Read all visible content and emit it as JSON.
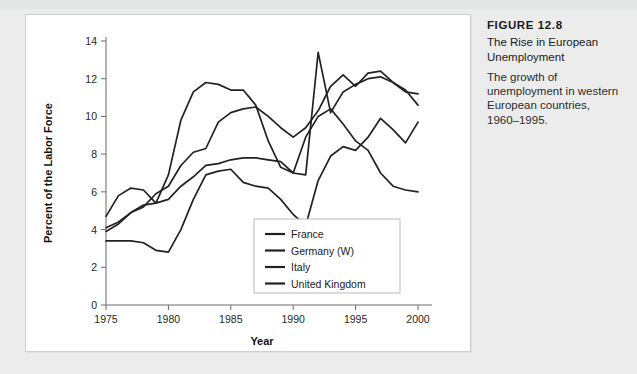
{
  "caption": {
    "figure_number": "FIGURE 12.8",
    "title": "The Rise in European Unemployment",
    "description": "The growth of unemployment in western European countries, 1960–1995."
  },
  "chart_data": {
    "type": "line",
    "title": "The Rise in European Unemployment",
    "xlabel": "Year",
    "ylabel": "Percent of the Labor Force",
    "xlim": [
      1975,
      2000
    ],
    "ylim": [
      0,
      14
    ],
    "xticks": [
      1975,
      1980,
      1985,
      1990,
      1995,
      2000
    ],
    "yticks": [
      0,
      2,
      4,
      6,
      8,
      10,
      12,
      14
    ],
    "grid": false,
    "legend_position": "lower center",
    "x": [
      1975,
      1976,
      1977,
      1978,
      1979,
      1980,
      1981,
      1982,
      1983,
      1984,
      1985,
      1986,
      1987,
      1988,
      1989,
      1990,
      1991,
      1992,
      1993,
      1994,
      1995,
      1996,
      1997,
      1998,
      1999,
      2000
    ],
    "series": [
      {
        "name": "France",
        "values": [
          4.1,
          4.4,
          4.9,
          5.2,
          5.9,
          6.3,
          7.4,
          8.1,
          8.3,
          9.7,
          10.2,
          10.4,
          10.5,
          10.0,
          9.4,
          8.9,
          9.4,
          10.3,
          11.6,
          12.2,
          11.6,
          12.3,
          12.4,
          11.8,
          11.3,
          11.2
        ]
      },
      {
        "name": "Germany (W)",
        "values": [
          3.4,
          3.4,
          3.4,
          3.3,
          2.9,
          2.8,
          4.0,
          5.6,
          6.9,
          7.1,
          7.2,
          6.5,
          6.3,
          6.2,
          5.6,
          4.8,
          4.2,
          6.6,
          7.9,
          8.4,
          8.2,
          8.9,
          9.9,
          9.3,
          8.6,
          9.7
        ]
      },
      {
        "name": "Italy",
        "values": [
          3.9,
          4.3,
          4.9,
          5.3,
          5.4,
          5.6,
          6.3,
          6.8,
          7.4,
          7.5,
          7.7,
          7.8,
          7.8,
          7.7,
          7.6,
          7.0,
          6.9,
          13.4,
          10.2,
          11.3,
          11.7,
          12.0,
          12.1,
          11.8,
          11.4,
          10.6
        ]
      },
      {
        "name": "United Kingdom",
        "values": [
          4.7,
          5.8,
          6.2,
          6.1,
          5.4,
          6.9,
          9.8,
          11.3,
          11.8,
          11.7,
          11.4,
          11.4,
          10.6,
          8.7,
          7.3,
          7.0,
          8.9,
          10.0,
          10.4,
          9.6,
          8.7,
          8.2,
          7.0,
          6.3,
          6.1,
          6.0
        ]
      }
    ],
    "legend": [
      "France",
      "Germany (W)",
      "Italy",
      "United Kingdom"
    ],
    "line_color": "#222222"
  }
}
